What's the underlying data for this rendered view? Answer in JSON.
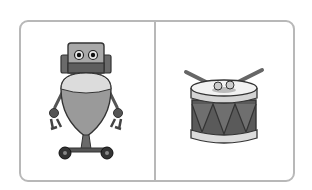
{
  "panels": [
    {
      "id": "robot",
      "label": "robot",
      "icon": "robot-icon"
    },
    {
      "id": "drum",
      "label": "drum",
      "icon": "drum-icon"
    }
  ],
  "colors": {
    "border": "#b8b8b8",
    "dark": "#3a3a3a",
    "mid": "#8a8a8a",
    "light": "#d4d4d4",
    "lighter": "#e6e6e6"
  }
}
